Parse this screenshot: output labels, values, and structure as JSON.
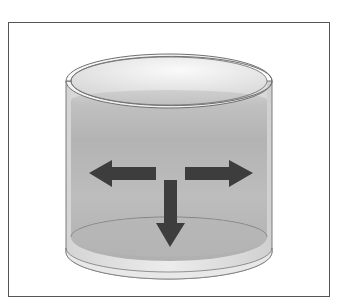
{
  "diagram": {
    "arrows": [
      {
        "id": "left",
        "direction": "left",
        "meaning": "pressure on side wall"
      },
      {
        "id": "right",
        "direction": "right",
        "meaning": "pressure on side wall"
      },
      {
        "id": "down",
        "direction": "down",
        "meaning": "pressure on bottom"
      }
    ],
    "colors": {
      "frame_border": "#555555",
      "arrow_fill": "#3d3d3d",
      "liquid": "#b5b5b5",
      "glass_outline": "#6f6f6f",
      "background": "#ffffff"
    }
  }
}
